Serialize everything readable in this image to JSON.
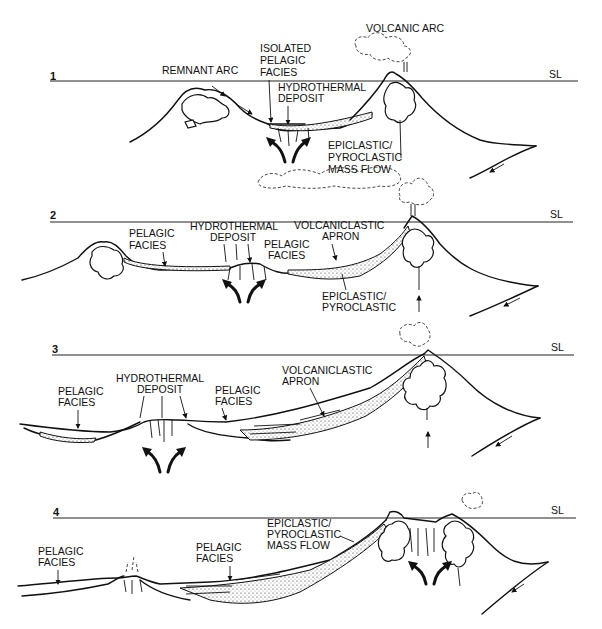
{
  "figure": {
    "sea_level_label": "SL",
    "panels": [
      {
        "number": "1",
        "labels": {
          "remnant_arc": "REMNANT ARC",
          "isolated_pelagic": [
            "ISOLATED",
            "PELAGIC",
            "FACIES"
          ],
          "hydrothermal": [
            "HYDROTHERMAL",
            "DEPOSIT"
          ],
          "volcanic_arc": "VOLCANIC ARC",
          "epiclastic": [
            "EPICLASTIC/",
            "PYROCLASTIC",
            "MASS FLOW"
          ]
        }
      },
      {
        "number": "2",
        "labels": {
          "pelagic_left": [
            "PELAGIC",
            "FACIES"
          ],
          "hydrothermal": [
            "HYDROTHERMAL",
            "DEPOSIT"
          ],
          "pelagic_right": [
            "PELAGIC",
            "FACIES"
          ],
          "volcaniclastic": [
            "VOLCANICLASTIC",
            "APRON"
          ],
          "epiclastic": [
            "EPICLASTIC/",
            "PYROCLASTIC"
          ]
        }
      },
      {
        "number": "3",
        "labels": {
          "pelagic_left": [
            "PELAGIC",
            "FACIES"
          ],
          "hydrothermal": [
            "HYDROTHERMAL",
            "DEPOSIT"
          ],
          "pelagic_right": [
            "PELAGIC",
            "FACIES"
          ],
          "volcaniclastic": [
            "VOLCANICLASTIC",
            "APRON"
          ]
        }
      },
      {
        "number": "4",
        "labels": {
          "pelagic_left": [
            "PELAGIC",
            "FACIES"
          ],
          "pelagic_right": [
            "PELAGIC",
            "FACIES"
          ],
          "epiclastic": [
            "EPICLASTIC/",
            "PYROCLASTIC",
            "MASS FLOW"
          ]
        }
      }
    ]
  }
}
